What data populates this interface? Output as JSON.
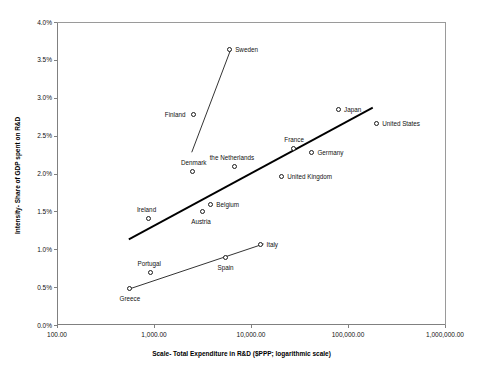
{
  "chart_data": {
    "type": "scatter",
    "title": "",
    "xlabel": "Scale- Total Expenditure in R&D ($PPP; logarithmic scale)",
    "ylabel": "Intensity- Share of GDP spent on R&D",
    "xscale": "log",
    "xlim": [
      100,
      1000000
    ],
    "ylim": [
      0,
      4
    ],
    "yunit": "%",
    "grid": false,
    "legend": "none",
    "xticks": [
      "100.00",
      "1,000.00",
      "10,000.00",
      "100,000.00",
      "1,000,000.00"
    ],
    "xtick_values": [
      100,
      1000,
      10000,
      100000,
      1000000
    ],
    "yticks": [
      "0.0%",
      "0.5%",
      "1.0%",
      "1.5%",
      "2.0%",
      "2.5%",
      "3.0%",
      "3.5%",
      "4.0%"
    ],
    "ytick_values": [
      0,
      0.5,
      1.0,
      1.5,
      2.0,
      2.5,
      3.0,
      3.5,
      4.0
    ],
    "points": [
      {
        "name": "Sweden",
        "x": 6100,
        "y": 3.63,
        "label_pos": "right"
      },
      {
        "name": "Finland",
        "x": 2600,
        "y": 2.77,
        "label_pos": "left"
      },
      {
        "name": "Japan",
        "x": 81000,
        "y": 2.84,
        "label_pos": "right"
      },
      {
        "name": "United States",
        "x": 200000,
        "y": 2.66,
        "label_pos": "right"
      },
      {
        "name": "France",
        "x": 28000,
        "y": 2.32,
        "label_pos": "above"
      },
      {
        "name": "Germany",
        "x": 43000,
        "y": 2.27,
        "label_pos": "right"
      },
      {
        "name": "the Netherlands",
        "x": 6800,
        "y": 2.08,
        "label_pos": "above"
      },
      {
        "name": "Denmark",
        "x": 2500,
        "y": 2.02,
        "label_pos": "above"
      },
      {
        "name": "United Kingdom",
        "x": 21000,
        "y": 1.95,
        "label_pos": "right"
      },
      {
        "name": "Belgium",
        "x": 3900,
        "y": 1.59,
        "label_pos": "right"
      },
      {
        "name": "Austria",
        "x": 3200,
        "y": 1.49,
        "label_pos": "below"
      },
      {
        "name": "Ireland",
        "x": 880,
        "y": 1.4,
        "label_pos": "above"
      },
      {
        "name": "Italy",
        "x": 12800,
        "y": 1.06,
        "label_pos": "right"
      },
      {
        "name": "Spain",
        "x": 5500,
        "y": 0.88,
        "label_pos": "below"
      },
      {
        "name": "Portugal",
        "x": 930,
        "y": 0.68,
        "label_pos": "above"
      },
      {
        "name": "Greece",
        "x": 560,
        "y": 0.48,
        "label_pos": "below"
      }
    ],
    "trendlines": [
      {
        "name": "upper-trendline",
        "x0": 550,
        "y0": 1.13,
        "x1": 180000,
        "y1": 2.87,
        "width": 1.8
      },
      {
        "name": "lower-trendline",
        "x0": 540,
        "y0": 0.47,
        "x1": 13500,
        "y1": 1.07,
        "width": 0.8
      },
      {
        "name": "nordic-connector",
        "x0": 2450,
        "y0": 2.28,
        "x1": 6150,
        "y1": 3.63,
        "width": 0.8
      }
    ]
  },
  "colors": {
    "axis": "#808080",
    "marker_edge": "#1a1a1a",
    "marker_fill": "#ffffff",
    "trend": "#000000",
    "text": "#111111",
    "background": "#ffffff"
  }
}
